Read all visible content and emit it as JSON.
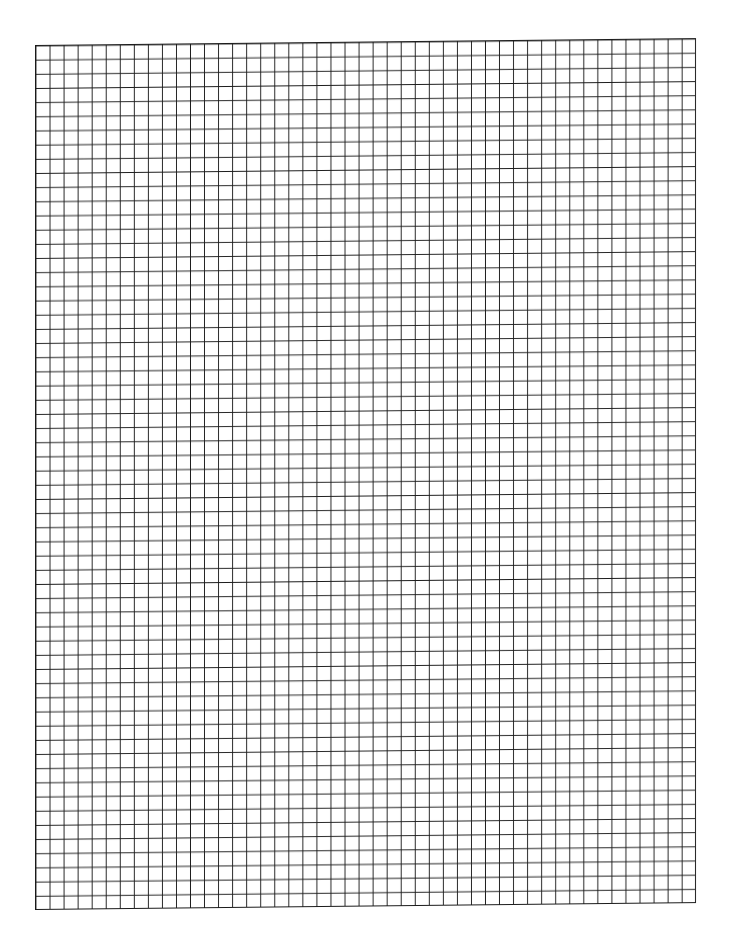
{
  "page": {
    "type": "graph-paper",
    "grid": {
      "columns": 47,
      "rows": 61,
      "line_color": "#1a1a1a",
      "background_color": "#ffffff"
    }
  }
}
